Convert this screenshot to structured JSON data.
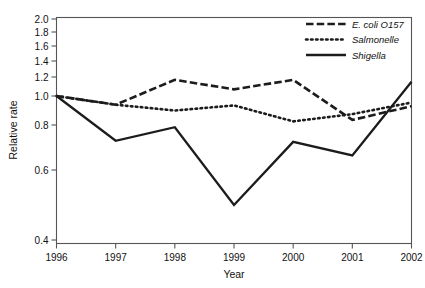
{
  "chart_data": {
    "type": "line",
    "title": "",
    "xlabel": "Year",
    "ylabel": "Relative rate",
    "x": [
      1996,
      1997,
      1998,
      1999,
      2000,
      2001,
      2002
    ],
    "xtick_labels": [
      "1996",
      "1997",
      "1998",
      "1999",
      "2000",
      "2001",
      "2002"
    ],
    "ytick_labels": [
      "2.0",
      "1.8",
      "1.6",
      "1.4",
      "1.2",
      "1.0",
      "0.8",
      "0.6",
      "0.4"
    ],
    "ytick_values": [
      2.0,
      1.8,
      1.6,
      1.4,
      1.2,
      1.0,
      0.8,
      0.6,
      0.4
    ],
    "ylim": [
      0.4,
      2.0
    ],
    "yscale": "nonlinear-reciprocal",
    "grid": false,
    "legend_position": "top-right",
    "series": [
      {
        "name": "E. coli O157",
        "style": "dashed",
        "color": "#1c1c1c",
        "values": [
          1.0,
          0.94,
          1.17,
          1.07,
          1.17,
          0.835,
          0.93
        ]
      },
      {
        "name": "Salmonelle",
        "style": "dotted",
        "color": "#1c1c1c",
        "values": [
          1.0,
          0.94,
          0.9,
          0.935,
          0.825,
          0.875,
          0.955
        ]
      },
      {
        "name": "Shigella",
        "style": "solid",
        "color": "#1c1c1c",
        "values": [
          1.0,
          0.73,
          0.79,
          0.5,
          0.725,
          0.665,
          1.15
        ]
      }
    ]
  },
  "legend": {
    "items": [
      {
        "label": "E. coli O157",
        "style": "dashed"
      },
      {
        "label": "Salmonelle",
        "style": "dotted"
      },
      {
        "label": "Shigella",
        "style": "solid"
      }
    ]
  },
  "axes": {
    "x_title": "Year",
    "y_title": "Relative rate"
  }
}
